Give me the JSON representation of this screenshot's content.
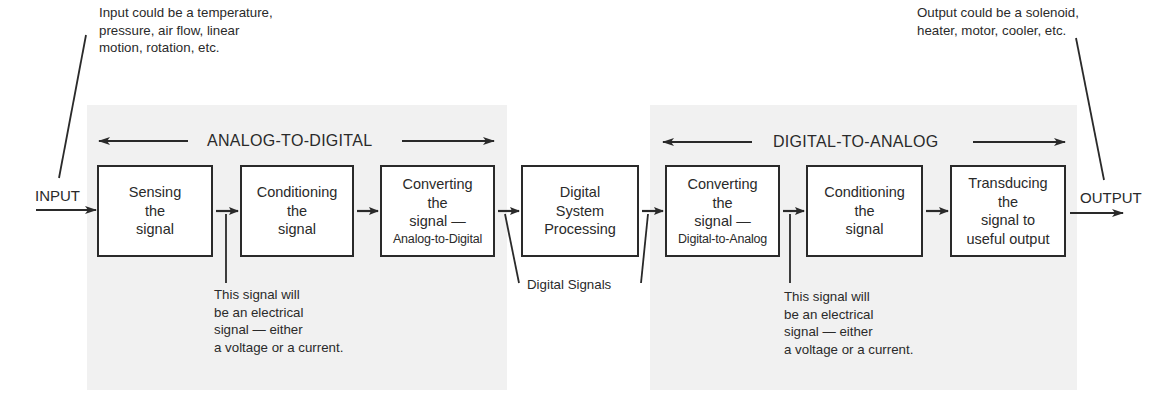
{
  "diagram": {
    "title_sections": {
      "analog_to_digital": "ANALOG-TO-DIGITAL",
      "digital_to_analog": "DIGITAL-TO-ANALOG"
    },
    "input": {
      "label": "INPUT",
      "note": "Input could be a temperature,\npressure, air flow, linear\nmotion, rotation, etc."
    },
    "output": {
      "label": "OUTPUT",
      "note": "Output could be a solenoid,\nheater, motor, cooler, etc."
    },
    "blocks": [
      {
        "id": "sensing",
        "lines": [
          "Sensing",
          "the",
          "signal"
        ]
      },
      {
        "id": "conditioning-a",
        "lines": [
          "Conditioning",
          "the",
          "signal"
        ]
      },
      {
        "id": "converting-a2d",
        "lines": [
          "Converting",
          "the",
          "signal —"
        ],
        "sub": "Analog-to-Digital"
      },
      {
        "id": "digital-processing",
        "lines": [
          "Digital",
          "System",
          "Processing"
        ]
      },
      {
        "id": "converting-d2a",
        "lines": [
          "Converting",
          "the",
          "signal —"
        ],
        "sub": "Digital-to-Analog"
      },
      {
        "id": "conditioning-b",
        "lines": [
          "Conditioning",
          "the",
          "signal"
        ]
      },
      {
        "id": "transducing",
        "lines": [
          "Transducing",
          "the",
          "signal to",
          "useful output"
        ]
      }
    ],
    "annotations": {
      "electrical_signal_left": "This signal will\nbe an electrical\nsignal — either\na voltage or a current.",
      "digital_signals": "Digital Signals",
      "electrical_signal_right": "This signal will\nbe an electrical\nsignal — either\na voltage or a current."
    },
    "colors": {
      "panel_background": "#f1f1f1",
      "line": "#2a2a2a",
      "box_fill": "#ffffff"
    }
  }
}
